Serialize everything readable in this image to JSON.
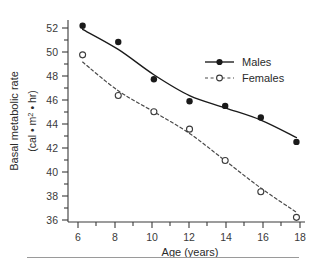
{
  "chart_data": {
    "type": "line",
    "title": "",
    "xlabel": "Age (years)",
    "ylabel": "Basal metabolic rate",
    "ylabel_units": "(cal • m² • hr)",
    "ylabel_units_parts": {
      "open": "(cal • m",
      "exponent": "2",
      "close": " • hr)"
    },
    "x": [
      6,
      8,
      10,
      12,
      14,
      16,
      18
    ],
    "xticklabels": [
      "6",
      "8",
      "10",
      "12",
      "14",
      "16",
      "18"
    ],
    "yticklabels": [
      "36",
      "38",
      "40",
      "42",
      "44",
      "46",
      "48",
      "50",
      "52"
    ],
    "yticks": [
      36,
      38,
      40,
      42,
      44,
      46,
      48,
      50,
      52
    ],
    "xlim": [
      5.3,
      18.6
    ],
    "ylim": [
      36,
      53.4
    ],
    "grid": false,
    "legend_position": "right-upper-inside",
    "series": [
      {
        "name": "Males",
        "marker": "filled-circle",
        "linestyle": "solid",
        "color": "#1a1a1a",
        "values": [
          52.9,
          51.5,
          48.3,
          46.4,
          46.0,
          45.0,
          42.9
        ]
      },
      {
        "name": "Females",
        "marker": "open-circle",
        "linestyle": "dashed",
        "color": "#4a4a4a",
        "values": [
          50.4,
          46.9,
          45.5,
          44.0,
          41.3,
          38.6,
          36.4
        ]
      }
    ]
  },
  "legend": {
    "entries": [
      {
        "label": "Males"
      },
      {
        "label": "Females"
      }
    ]
  }
}
